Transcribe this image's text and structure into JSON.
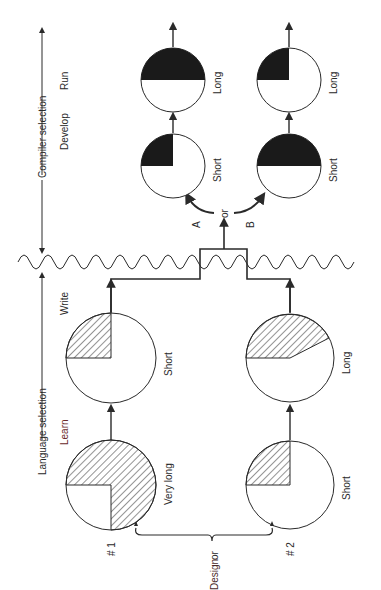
{
  "diagram": {
    "phases": {
      "language_selection": "Language selection",
      "compiler_selection": "Compiler selection"
    },
    "steps": {
      "learn": "Learn",
      "write": "Write",
      "develop": "Develop",
      "run": "Run"
    },
    "design": {
      "label": "Design",
      "or": "or",
      "options": [
        "# 1",
        "# 2"
      ]
    },
    "branch": {
      "or": "or",
      "a": "A",
      "b": "B"
    },
    "language_path_1": {
      "learn": {
        "label": "Very long",
        "fill": "hatched",
        "fraction": 0.75
      },
      "write": {
        "label": "Short",
        "fill": "hatched",
        "fraction": 0.25
      }
    },
    "language_path_2": {
      "learn": {
        "label": "Short",
        "fill": "hatched",
        "fraction": 0.25
      },
      "write": {
        "label": "Long",
        "fill": "hatched",
        "fraction": 0.42
      }
    },
    "compiler_path_a": {
      "develop": {
        "label": "Short",
        "fill": "solid",
        "fraction": 0.25
      },
      "run": {
        "label": "Long",
        "fill": "solid",
        "fraction": 0.5
      }
    },
    "compiler_path_b": {
      "develop": {
        "label": "Short",
        "fill": "solid",
        "fraction": 0.5
      },
      "run": {
        "label": "Long",
        "fill": "solid",
        "fraction": 0.25
      }
    },
    "colors": {
      "ink": "#2a2a2a",
      "solid_fill": "#1a1a1a",
      "background": "#ffffff"
    }
  }
}
